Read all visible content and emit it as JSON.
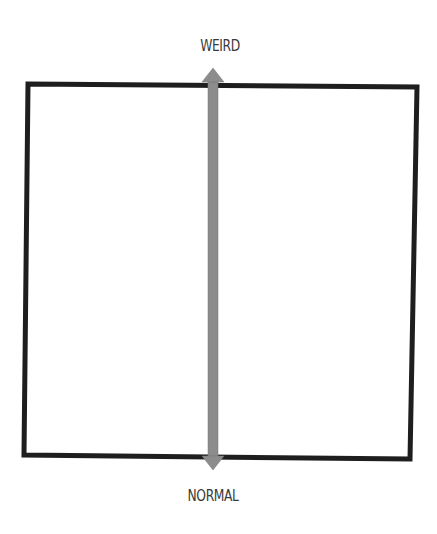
{
  "diagram": {
    "type": "single-axis spectrum",
    "axis": {
      "orientation": "vertical",
      "top_label": "WEIRD",
      "bottom_label": "NORMAL",
      "direction": "bidirectional"
    },
    "frame": {
      "shape": "square",
      "stroke_color": "#1e1e1e",
      "stroke_width": 5
    },
    "arrow": {
      "fill_color": "#8c8c8c",
      "edge_color": "#6e6e6e"
    }
  }
}
